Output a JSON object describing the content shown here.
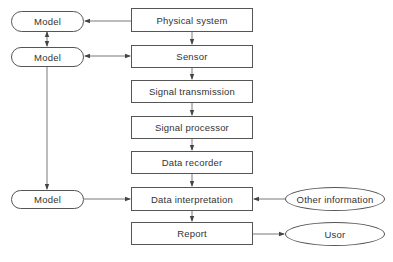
{
  "diagram": {
    "pipeline": [
      {
        "id": "physical",
        "label": "Physical system"
      },
      {
        "id": "sensor",
        "label": "Sensor"
      },
      {
        "id": "transmission",
        "label": "Signal transmission"
      },
      {
        "id": "processor",
        "label": "Signal processor"
      },
      {
        "id": "recorder",
        "label": "Data recorder"
      },
      {
        "id": "interpretation",
        "label": "Data interpretation"
      },
      {
        "id": "report",
        "label": "Report"
      }
    ],
    "models": [
      {
        "id": "model1",
        "label": "Model"
      },
      {
        "id": "model2",
        "label": "Model"
      },
      {
        "id": "model3",
        "label": "Model"
      }
    ],
    "externals": [
      {
        "id": "other",
        "label": "Other information"
      },
      {
        "id": "user",
        "label": "Usor"
      }
    ],
    "edges": [
      {
        "from": "physical",
        "to": "sensor"
      },
      {
        "from": "sensor",
        "to": "transmission"
      },
      {
        "from": "transmission",
        "to": "processor"
      },
      {
        "from": "processor",
        "to": "recorder"
      },
      {
        "from": "recorder",
        "to": "interpretation"
      },
      {
        "from": "interpretation",
        "to": "report"
      },
      {
        "from": "physical",
        "to": "model1"
      },
      {
        "from": "model1",
        "to": "model2",
        "bidirectional": true
      },
      {
        "from": "model2",
        "to": "sensor",
        "bidirectional": true
      },
      {
        "from": "model2",
        "to": "model3"
      },
      {
        "from": "model3",
        "to": "interpretation"
      },
      {
        "from": "other",
        "to": "interpretation"
      },
      {
        "from": "report",
        "to": "user"
      }
    ],
    "line_color": "#555555"
  }
}
